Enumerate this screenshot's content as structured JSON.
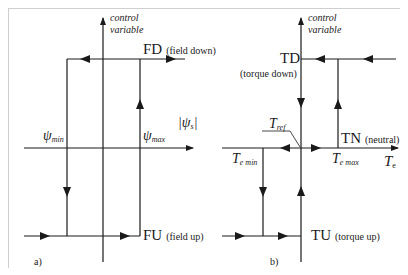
{
  "panel_a": {
    "caption": "a)",
    "axis_label_line1": "control",
    "axis_label_line2": "variable",
    "top_state": "FD",
    "top_state_desc": "(field down)",
    "bottom_state": "FU",
    "bottom_state_desc": "(field up)",
    "threshold_min_sym": "ψ",
    "threshold_min_sub": "min",
    "threshold_max_sym": "ψ",
    "threshold_max_sub": "max",
    "x_axis_label": "|ψ",
    "x_axis_sub": "s",
    "x_axis_close": "|"
  },
  "panel_b": {
    "caption": "b)",
    "axis_label_line1": "control",
    "axis_label_line2": "variable",
    "top_state": "TD",
    "top_state_desc": "(torque down)",
    "mid_state": "TN",
    "mid_state_desc": "(neutral)",
    "bottom_state": "TU",
    "bottom_state_desc": "(torque up)",
    "ref_sym": "T",
    "ref_sub": "ref",
    "threshold_min_sym": "T",
    "threshold_min_sub": "e min",
    "threshold_max_sym": "T",
    "threshold_max_sub": "e max",
    "x_axis_sym": "T",
    "x_axis_sub": "e"
  },
  "colors": {
    "line": "#1a1a1a",
    "frame": "#cfcfcf"
  }
}
